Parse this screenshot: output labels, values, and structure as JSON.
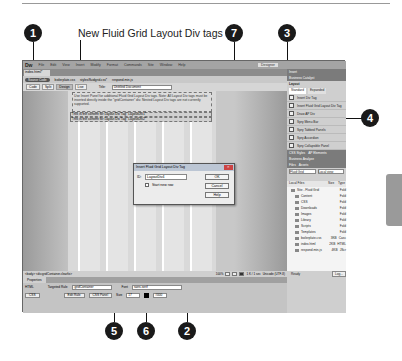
{
  "caption": "New Fluid Grid Layout Div tags",
  "callouts": [
    "1",
    "7",
    "3",
    "4",
    "5",
    "6",
    "2"
  ],
  "app": {
    "logo": "Dw",
    "menu": [
      "File",
      "Edit",
      "View",
      "Insert",
      "Modify",
      "Format",
      "Commands",
      "Site",
      "Window",
      "Help"
    ],
    "workspace": "Designer",
    "doc_tab": "index.html*",
    "related_files": [
      "Source Code",
      "boilerplate.css",
      "styles/fluidgrid.css*",
      "respond.min.js"
    ],
    "toolbar": {
      "code": "Code",
      "split": "Split",
      "design": "Design",
      "live": "Live",
      "title_label": "Title:",
      "title_value": "Untitled Document"
    },
    "info_text": "Use Insert Panel for additional Fluid Grid Layout Div tags. Note: All Layout Div tags must be inserted directly inside the \"gridContainer\" div. Nested Layout Div tags are not currently supported.",
    "div_line_1": "This is the content for Layout Div Tag \"LayoutDiv1\"",
    "div_line_2": "This is the content for Layout Div Tag \"LayoutDiv2\"",
    "status": {
      "tags": "<body> <div.gridContainer.clearfix>",
      "zoom": "100%",
      "size": "1 K / 1 sec",
      "encoding": "Unicode (UTF-8)"
    },
    "properties": {
      "title": "Properties",
      "html": "HTML",
      "css": "CSS",
      "targeted_rule_label": "Targeted Rule",
      "targeted_rule": ".gridContainer",
      "edit_rule": "Edit Rule",
      "css_panel": "CSS Panel",
      "font_label": "Font",
      "font_value": "sans-serif",
      "size_label": "Size",
      "size_value": "17",
      "color_value": "#000"
    }
  },
  "panel": {
    "insert_tab": "Insert",
    "business_catalyst": "Business Catalyst",
    "category": "Layout",
    "tabs": [
      "Standard",
      "Expanded"
    ],
    "items": [
      "Insert Div Tag",
      "Insert Fluid Grid Layout Div Tag",
      "Draw AP Div",
      "Spry Menu Bar",
      "Spry Tabbed Panels",
      "Spry Accordion",
      "Spry Collapsible Panel"
    ],
    "css_tabs": [
      "CSS Styles",
      "AP Elements"
    ],
    "bus_analyze": "Business Analyze",
    "files_tabs": [
      "Files",
      "Assets"
    ],
    "site_select": "Fluid Grid",
    "view_select": "Local view",
    "files_header": [
      "Local Files",
      "Size",
      "Type"
    ],
    "files": [
      {
        "name": "Site - Fluid Grid",
        "size": "",
        "type": "Fold"
      },
      {
        "name": "Content",
        "size": "",
        "type": "Fold"
      },
      {
        "name": "CSS",
        "size": "",
        "type": "Fold"
      },
      {
        "name": "Downloads",
        "size": "",
        "type": "Fold"
      },
      {
        "name": "Images",
        "size": "",
        "type": "Fold"
      },
      {
        "name": "Library",
        "size": "",
        "type": "Fold"
      },
      {
        "name": "Scripts",
        "size": "",
        "type": "Fold"
      },
      {
        "name": "Templates",
        "size": "",
        "type": "Fold"
      },
      {
        "name": "boilerplate.css",
        "size": "3KB",
        "type": "Casc"
      },
      {
        "name": "index.html",
        "size": "2KB",
        "type": "HTML"
      },
      {
        "name": "respond.min.js",
        "size": "4KB",
        "type": "JScr"
      }
    ],
    "ready": "Ready",
    "log": "Log..."
  },
  "dialog": {
    "title": "Insert Fluid Grid Layout Div Tag",
    "id_label": "ID:",
    "id_value": "LayoutDiv4",
    "checkbox_label": "Start new row",
    "ok": "OK",
    "cancel": "Cancel",
    "help": "Help"
  }
}
